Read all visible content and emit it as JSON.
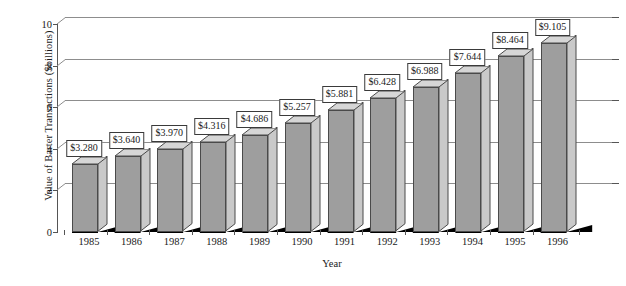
{
  "chart_data": {
    "type": "bar",
    "title": "",
    "xlabel": "Year",
    "ylabel": "Value of Barter Transactions ($billions)",
    "categories": [
      "1985",
      "1986",
      "1987",
      "1988",
      "1989",
      "1990",
      "1991",
      "1992",
      "1993",
      "1994",
      "1995",
      "1996"
    ],
    "values": [
      3.28,
      3.64,
      3.97,
      4.316,
      4.686,
      5.257,
      5.881,
      6.428,
      6.988,
      7.644,
      8.464,
      9.105
    ],
    "data_labels": [
      "$3.280",
      "$3.640",
      "$3.970",
      "$4.316",
      "$4.686",
      "$5.257",
      "$5.881",
      "$6.428",
      "$6.988",
      "$7.644",
      "$8.464",
      "$9.105"
    ],
    "ylim": [
      0,
      10
    ],
    "yticks": [
      0,
      2,
      4,
      6,
      8,
      10
    ],
    "ytick_labels": [
      "0",
      "2",
      "4",
      "6",
      "8",
      "10"
    ],
    "grid": true,
    "legend": false,
    "style": "3d-column",
    "colors": {
      "bar_front": "#9e9e9e",
      "bar_top": "#d6d6d6",
      "bar_side": "#c9c9c9",
      "bar_edge": "#4a4a4a",
      "gridline": "#8d8d8d",
      "axis": "#555555",
      "floor": "#000000",
      "label_box_bg": "#ffffff",
      "label_box_border": "#3a3a3a",
      "text": "#1a1a1a"
    }
  }
}
